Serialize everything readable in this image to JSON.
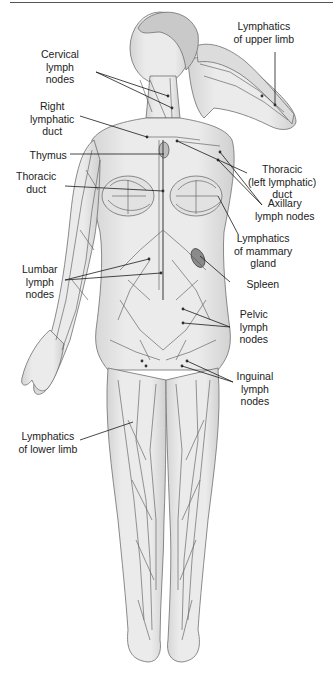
{
  "diagram": {
    "colors": {
      "skin": "#e6e6e6",
      "skin_shade": "#cfcfcf",
      "outline": "#6f6f6f",
      "vessel": "#555555",
      "leader": "#1a1a1a",
      "spleen": "#8a8a8a",
      "text": "#222222"
    },
    "labels": [
      {
        "id": "cervical",
        "text": "Cervical\nlymph\nnodes",
        "x": 60,
        "y": 48,
        "targets": [
          [
            172,
            108
          ],
          [
            168,
            96
          ]
        ],
        "from": [
          96,
          72
        ]
      },
      {
        "id": "upper-limb",
        "text": "Lymphatics\nof upper limb",
        "x": 264,
        "y": 20,
        "targets": [
          [
            275,
            105
          ]
        ],
        "from": [
          275,
          52
        ]
      },
      {
        "id": "right-duct",
        "text": "Right\nlymphatic\nduct",
        "x": 52,
        "y": 100,
        "targets": [
          [
            147,
            137
          ]
        ],
        "from": [
          80,
          116
        ]
      },
      {
        "id": "thymus",
        "text": "Thymus",
        "x": 48,
        "y": 149,
        "targets": [
          [
            164,
            154
          ]
        ],
        "from": [
          70,
          154
        ]
      },
      {
        "id": "thoracic-left",
        "text": "Thoracic\n(left lymphatic)\nduct",
        "x": 282,
        "y": 163,
        "targets": [
          [
            177,
            141
          ]
        ],
        "from": [
          247,
          173
        ]
      },
      {
        "id": "thoracic-duct",
        "text": "Thoracic\nduct",
        "x": 36,
        "y": 170,
        "targets": [
          [
            163,
            191
          ]
        ],
        "from": [
          65,
          186
        ]
      },
      {
        "id": "axillary",
        "text": "Axillary\nlymph nodes",
        "x": 285,
        "y": 197,
        "targets": [
          [
            218,
            160
          ],
          [
            220,
            152
          ]
        ],
        "from": [
          262,
          205
        ]
      },
      {
        "id": "mammary",
        "text": "Lymphatics\nof mammary\ngland",
        "x": 263,
        "y": 232,
        "targets": [
          [
            218,
            196
          ]
        ],
        "from": [
          238,
          234
        ]
      },
      {
        "id": "spleen",
        "text": "Spleen",
        "x": 263,
        "y": 278,
        "targets": [
          [
            200,
            256
          ]
        ],
        "from": [
          230,
          282
        ]
      },
      {
        "id": "lumbar",
        "text": "Lumbar\nlymph\nnodes",
        "x": 40,
        "y": 263,
        "targets": [
          [
            149,
            259
          ],
          [
            161,
            273
          ]
        ],
        "from": [
          65,
          280
        ]
      },
      {
        "id": "pelvic",
        "text": "Pelvic\nlymph\nnodes",
        "x": 254,
        "y": 308,
        "targets": [
          [
            183,
            309
          ],
          [
            183,
            323
          ]
        ],
        "from": [
          230,
          327
        ]
      },
      {
        "id": "inguinal",
        "text": "Inguinal\nlymph\nnodes",
        "x": 255,
        "y": 370,
        "targets": [
          [
            187,
            361
          ],
          [
            182,
            366
          ]
        ],
        "from": [
          233,
          382
        ]
      },
      {
        "id": "lower-limb",
        "text": "Lymphatics\nof lower limb",
        "x": 48,
        "y": 430,
        "targets": [
          [
            133,
            422
          ]
        ],
        "from": [
          80,
          440
        ]
      }
    ]
  }
}
